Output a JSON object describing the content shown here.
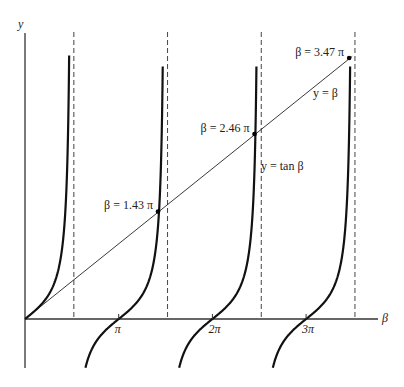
{
  "chart_data": {
    "type": "line",
    "title": "",
    "xlabel": "β",
    "ylabel": "y",
    "xlim_pi": [
      0,
      3.75
    ],
    "ylim_pi": [
      -0.7,
      3.75
    ],
    "x_ticks": [
      {
        "value_pi": 1,
        "label": "π"
      },
      {
        "value_pi": 2,
        "label": "2π"
      },
      {
        "value_pi": 3,
        "label": "3π"
      }
    ],
    "asymptotes_pi": [
      0.5,
      1.5,
      2.5,
      3.5
    ],
    "series": [
      {
        "name": "y = tan β",
        "label": "y = tan β",
        "function": "tan"
      },
      {
        "name": "y = β",
        "label": "y = β",
        "function": "identity"
      }
    ],
    "intersections": [
      {
        "beta_pi": 1.43,
        "label": "β = 1.43 π"
      },
      {
        "beta_pi": 2.46,
        "label": "β = 2.46 π"
      },
      {
        "beta_pi": 3.47,
        "label": "β = 3.47 π"
      }
    ],
    "colors": {
      "curve": "#111111",
      "axis": "#333333",
      "asymptote": "#444444"
    }
  }
}
